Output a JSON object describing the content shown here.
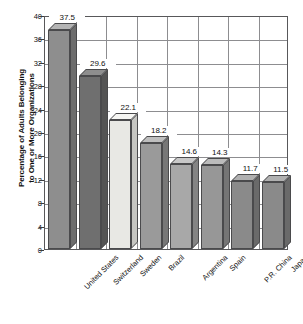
{
  "chart_data": {
    "type": "bar",
    "title": "",
    "subtitle": "",
    "xlabel": "",
    "ylabel": "Percentage of Adults Belonging to One or More Organizations",
    "ylabel_line1": "Percentage of Adults Belonging",
    "ylabel_line2": "to One or More Organizations",
    "categories": [
      "United States",
      "Switzerland",
      "Sweden",
      "Brazil",
      "Argentina",
      "Spain",
      "P.R. China",
      "Japan"
    ],
    "values": [
      37.5,
      29.6,
      22.1,
      18.2,
      14.6,
      14.3,
      11.7,
      11.5
    ],
    "value_labels": [
      "37.5",
      "29.6",
      "22.1",
      "18.2",
      "14.6",
      "14.3",
      "11.7",
      "11.5"
    ],
    "ylim": [
      0,
      40
    ],
    "yticks": [
      40,
      36,
      32,
      28,
      24,
      20,
      16,
      12,
      8,
      4,
      0
    ],
    "ytick_labels": [
      "40",
      "36",
      "32",
      "28",
      "24",
      "20",
      "16",
      "12",
      "8",
      "4",
      "0"
    ],
    "grid": "both",
    "legend": "none",
    "style": "3d-bars-grayscale",
    "bar_colors": [
      "#8e8e8e",
      "#6f6f6f",
      "#e8e8e4",
      "#9a9a9a",
      "#a8a8a8",
      "#979797",
      "#8a8a8a",
      "#8a8a8a"
    ],
    "bar_top_colors": [
      "#b4b4b4",
      "#8e8e8e",
      "#f6f6f3",
      "#bebebe",
      "#c8c8c8",
      "#bbbbbb",
      "#b0b0b0",
      "#b0b0b0"
    ],
    "bar_side_colors": [
      "#6d6d6d",
      "#545454",
      "#c6c6c2",
      "#777777",
      "#848484",
      "#757575",
      "#6a6a6a",
      "#6a6a6a"
    ],
    "axis_color": "#58585a",
    "grid_color": "#8d8d90",
    "background": "#ffffff"
  }
}
